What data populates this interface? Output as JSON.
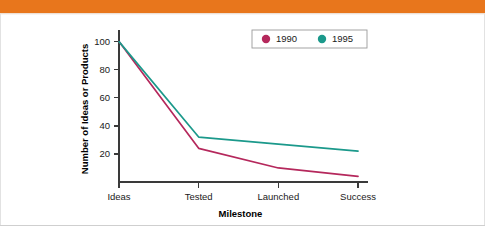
{
  "banner": {
    "color": "#E8761C",
    "label": "orange-header-band"
  },
  "frame": {
    "border_color": "#e2e2e2",
    "background": "#ffffff"
  },
  "chart_data": {
    "type": "line",
    "title": "",
    "subtitle": "",
    "xlabel": "Milestone",
    "ylabel": "Number of Ideas or Products",
    "categories": [
      "Ideas",
      "Tested",
      "Launched",
      "Success"
    ],
    "series": [
      {
        "name": "1990",
        "color": "#B5285C",
        "marker": "circle",
        "values": [
          100,
          24,
          10,
          4
        ]
      },
      {
        "name": "1995",
        "color": "#1B998B",
        "marker": "circle",
        "values": [
          100,
          32,
          27,
          22
        ]
      }
    ],
    "yticks": [
      20,
      40,
      60,
      80,
      100
    ],
    "ytick_labels": [
      "20",
      "40",
      "60",
      "80",
      "100"
    ],
    "ylim": [
      0,
      104
    ],
    "xlim": [
      0,
      3
    ],
    "grid": false,
    "legend": {
      "position": "top-right",
      "boxed": true,
      "entries": [
        "1990",
        "1995"
      ]
    }
  }
}
